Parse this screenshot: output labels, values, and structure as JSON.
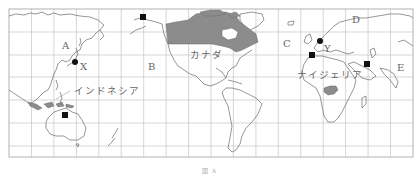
{
  "map": {
    "type": "world-map-pacific-centered",
    "frame": {
      "left": 9,
      "top": 9,
      "right": 413,
      "bottom": 157
    },
    "grid": {
      "cols": 18,
      "rows": 7,
      "color": "#bdbdbd"
    },
    "highlight_color": "#8c8c8c",
    "coast_color": "#666666",
    "highlighted_countries": [
      "Canada",
      "Nigeria"
    ],
    "labels": {
      "A": "A",
      "B": "B",
      "C": "C",
      "D": "D",
      "E": "E",
      "X": "X",
      "Y": "Y",
      "canada": "カナダ",
      "indonesia": "インドネシア",
      "nigeria": "ナイジェリア"
    },
    "markers": [
      {
        "id": "square-alaska",
        "shape": "square",
        "x": 143,
        "y": 17
      },
      {
        "id": "square-australia",
        "shape": "square",
        "x": 65,
        "y": 115
      },
      {
        "id": "square-iberia",
        "shape": "square",
        "x": 311,
        "y": 55
      },
      {
        "id": "square-middle-east",
        "shape": "square",
        "x": 366,
        "y": 64
      },
      {
        "id": "dot-japan-X",
        "shape": "dot",
        "x": 75,
        "y": 62
      },
      {
        "id": "dot-europe-Y",
        "shape": "dot",
        "x": 320,
        "y": 41
      }
    ],
    "caption": "図 A"
  }
}
